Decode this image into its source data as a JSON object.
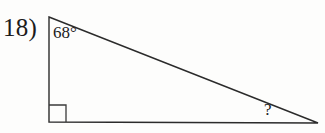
{
  "problem": {
    "number_label": "18)",
    "type": "right-triangle-angle-problem"
  },
  "figure": {
    "shape": "right-triangle",
    "stroke_color": "#2b2b2b",
    "fill_color": "none",
    "background_color": "#fdfdfc",
    "stroke_width": 1.4,
    "vertices": {
      "top_left": {
        "x": 49,
        "y": 17
      },
      "bottom_left": {
        "x": 49,
        "y": 122
      },
      "bottom_right": {
        "x": 318,
        "y": 123
      }
    },
    "right_angle_marker": {
      "at_vertex": "bottom_left",
      "size": 17,
      "x": 49,
      "y": 105
    }
  },
  "labels": {
    "top_angle": "68°",
    "unknown_angle": "?"
  }
}
